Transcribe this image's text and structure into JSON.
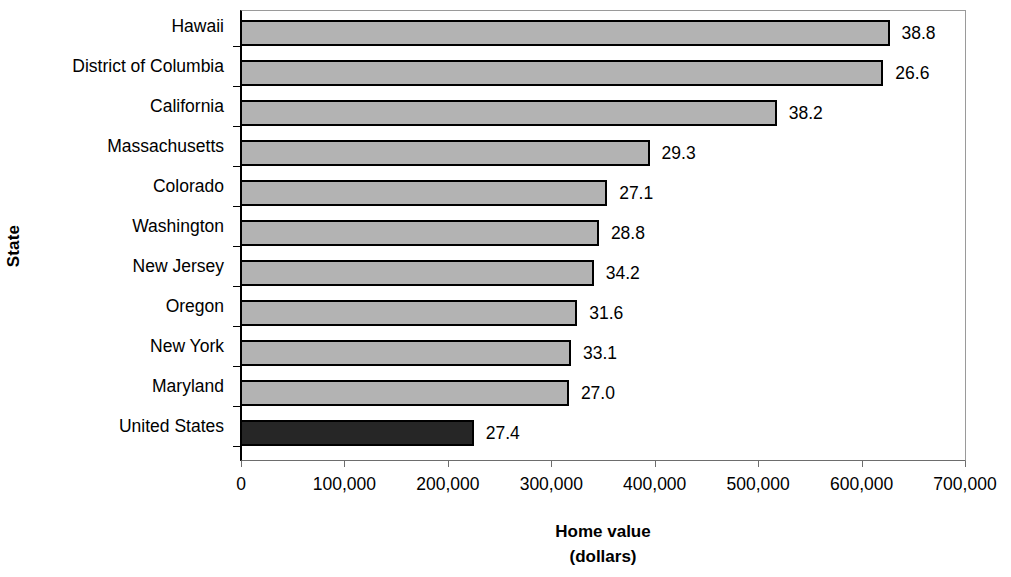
{
  "chart_data": {
    "type": "bar",
    "orientation": "horizontal",
    "title": "",
    "xlabel": "Home value",
    "xlabel_line2": "(dollars)",
    "ylabel": "State",
    "xlim": [
      0,
      700000
    ],
    "grid": false,
    "legend": "none",
    "xticks": [
      "0",
      "100,000",
      "200,000",
      "300,000",
      "400,000",
      "500,000",
      "600,000",
      "700,000"
    ],
    "xtick_values": [
      0,
      100000,
      200000,
      300000,
      400000,
      500000,
      600000,
      700000
    ],
    "categories": [
      "Hawaii",
      "District of Columbia",
      "California",
      "Massachusetts",
      "Colorado",
      "Washington",
      "New Jersey",
      "Oregon",
      "New York",
      "Maryland",
      "United States"
    ],
    "values": [
      628000,
      622000,
      519000,
      396000,
      355000,
      347000,
      342000,
      326000,
      320000,
      318000,
      226000
    ],
    "point_labels": [
      "38.8",
      "26.6",
      "38.2",
      "29.3",
      "27.1",
      "28.8",
      "34.2",
      "31.6",
      "33.1",
      "27.0",
      "27.4"
    ],
    "bar_colors": [
      "#b3b3b3",
      "#b3b3b3",
      "#b3b3b3",
      "#b3b3b3",
      "#b3b3b3",
      "#b3b3b3",
      "#b3b3b3",
      "#b3b3b3",
      "#b3b3b3",
      "#b3b3b3",
      "#262626"
    ],
    "highlight_category": "United States",
    "highlight_color": "#262626",
    "series_color": "#b3b3b3",
    "bar_edge_color": "#000000"
  }
}
